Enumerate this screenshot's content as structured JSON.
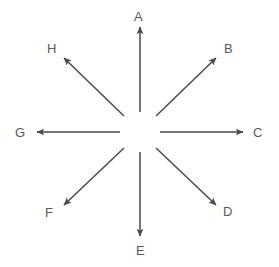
{
  "diagram": {
    "background_color": "#ffffff",
    "stroke_color": "#4a4a4c",
    "label_color": "#58595b",
    "center": {
      "x": 140,
      "y": 132
    },
    "inner_gap_radius": 22,
    "outer_radius": 108,
    "arrow_count": 8,
    "directions": [
      {
        "label": "A",
        "compass": "up",
        "angle_deg": 90,
        "label_x": 134,
        "label_y": 10,
        "tail": {
          "x": 140,
          "y": 112
        },
        "tip": {
          "x": 140,
          "y": 27
        }
      },
      {
        "label": "B",
        "compass": "up-right",
        "angle_deg": 45,
        "label_x": 224,
        "label_y": 42,
        "tail": {
          "x": 156,
          "y": 116
        },
        "tip": {
          "x": 216,
          "y": 58
        }
      },
      {
        "label": "C",
        "compass": "right",
        "angle_deg": 0,
        "label_x": 253,
        "label_y": 126,
        "tail": {
          "x": 160,
          "y": 132
        },
        "tip": {
          "x": 243,
          "y": 132
        }
      },
      {
        "label": "D",
        "compass": "down-right",
        "angle_deg": 315,
        "label_x": 223,
        "label_y": 205,
        "tail": {
          "x": 156,
          "y": 148
        },
        "tip": {
          "x": 216,
          "y": 205
        }
      },
      {
        "label": "E",
        "compass": "down",
        "angle_deg": 270,
        "label_x": 136,
        "label_y": 244,
        "tail": {
          "x": 140,
          "y": 152
        },
        "tip": {
          "x": 140,
          "y": 236
        }
      },
      {
        "label": "F",
        "compass": "down-left",
        "angle_deg": 225,
        "label_x": 45,
        "label_y": 206,
        "tail": {
          "x": 124,
          "y": 148
        },
        "tip": {
          "x": 64,
          "y": 205
        }
      },
      {
        "label": "G",
        "compass": "left",
        "angle_deg": 180,
        "label_x": 15,
        "label_y": 126,
        "tail": {
          "x": 120,
          "y": 132
        },
        "tip": {
          "x": 37,
          "y": 132
        }
      },
      {
        "label": "H",
        "compass": "up-left",
        "angle_deg": 135,
        "label_x": 47,
        "label_y": 42,
        "tail": {
          "x": 124,
          "y": 116
        },
        "tip": {
          "x": 64,
          "y": 58
        }
      }
    ]
  }
}
